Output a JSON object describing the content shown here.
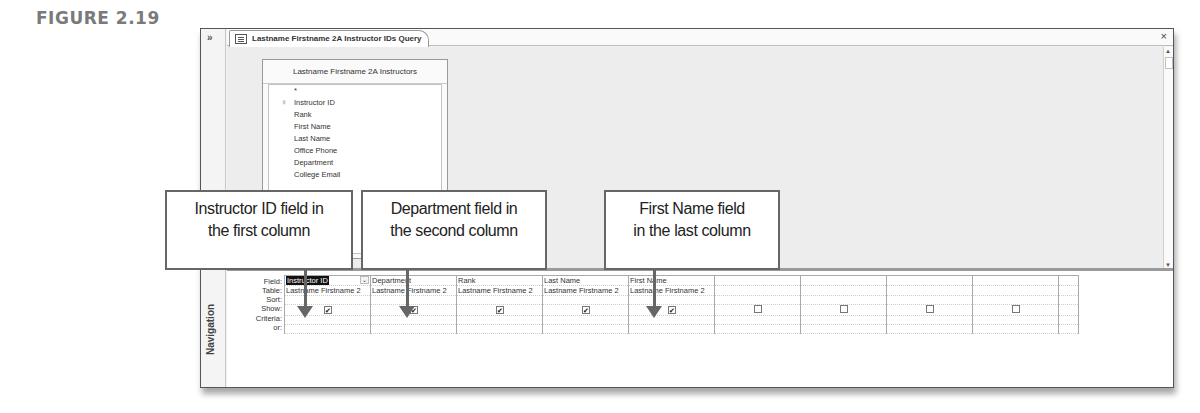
{
  "figure": {
    "label": "FIGURE 2.19"
  },
  "nav_pane": {
    "collapse_glyph": "»",
    "label": "Navigation"
  },
  "tab": {
    "title": "Lastname Firstname 2A Instructor IDs Query",
    "close_glyph": "×"
  },
  "field_list": {
    "title": "Lastname Firstname 2A Instructors",
    "items": [
      {
        "label": "*",
        "key": false
      },
      {
        "label": "Instructor ID",
        "key": true
      },
      {
        "label": "Rank",
        "key": false
      },
      {
        "label": "First Name",
        "key": false
      },
      {
        "label": "Last Name",
        "key": false
      },
      {
        "label": "Office Phone",
        "key": false
      },
      {
        "label": "Department",
        "key": false
      },
      {
        "label": "College Email",
        "key": false
      }
    ],
    "key_glyph": "🔑"
  },
  "scrollbars": {
    "up": "▲",
    "down": "▼",
    "left": "◄",
    "right": "►"
  },
  "design_grid": {
    "row_labels": [
      "Field:",
      "Table:",
      "Sort:",
      "Show:",
      "Criteria:",
      "or:"
    ],
    "columns": [
      {
        "field": "Instructor ID",
        "table": "Lastname Firstname 2",
        "show": true,
        "selected": true
      },
      {
        "field": "Department",
        "table": "Lastname Firstname 2",
        "show": true,
        "selected": false
      },
      {
        "field": "Rank",
        "table": "Lastname Firstname 2",
        "show": true,
        "selected": false
      },
      {
        "field": "Last Name",
        "table": "Lastname Firstname 2",
        "show": true,
        "selected": false
      },
      {
        "field": "First Name",
        "table": "Lastname Firstname 2",
        "show": true,
        "selected": false
      },
      {
        "field": "",
        "table": "",
        "show": false,
        "selected": false
      },
      {
        "field": "",
        "table": "",
        "show": false,
        "selected": false
      },
      {
        "field": "",
        "table": "",
        "show": false,
        "selected": false
      },
      {
        "field": "",
        "table": "",
        "show": false,
        "selected": false
      },
      {
        "field": "",
        "table": "",
        "show": false,
        "selected": false
      }
    ],
    "check_glyph": "✔"
  },
  "callouts": [
    {
      "line1": "Instructor ID field in",
      "line2": "the first column"
    },
    {
      "line1": "Department field in",
      "line2": "the second column"
    },
    {
      "line1": "First Name field",
      "line2": "in the last column"
    }
  ],
  "colors": {
    "callout_border": "#666666",
    "selection_bg": "#111111",
    "window_bg": "#ededed"
  }
}
